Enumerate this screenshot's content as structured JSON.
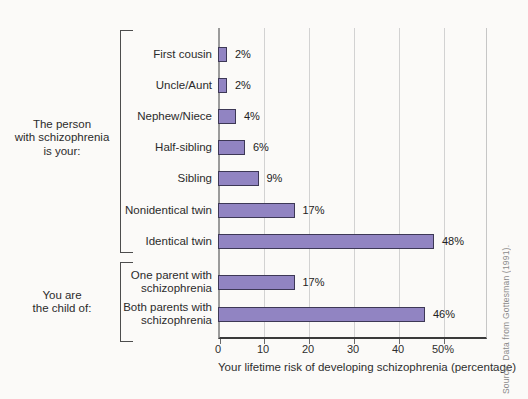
{
  "figure": {
    "background": "#fbfaf8"
  },
  "chart_data": {
    "type": "bar",
    "orientation": "horizontal",
    "title": "",
    "xlabel": "Your lifetime risk of developing schizophrenia (percentage)",
    "ylabel": "",
    "xlim": [
      0,
      59
    ],
    "xticks": [
      0,
      10,
      20,
      30,
      40,
      50
    ],
    "xtick_labels": [
      "0",
      "10",
      "20",
      "30",
      "40",
      "50%"
    ],
    "grid": true,
    "legend": "none",
    "bar_color": "#9184c2",
    "bar_border_color": "#3d3856",
    "groups": [
      {
        "label_lines": [
          "The person",
          "with schizophrenia",
          "is your:"
        ],
        "rows": [
          {
            "category_lines": [
              "First cousin"
            ],
            "value": 2,
            "value_label": "2%"
          },
          {
            "category_lines": [
              "Uncle/Aunt"
            ],
            "value": 2,
            "value_label": "2%"
          },
          {
            "category_lines": [
              "Nephew/Niece"
            ],
            "value": 4,
            "value_label": "4%"
          },
          {
            "category_lines": [
              "Half-sibling"
            ],
            "value": 6,
            "value_label": "6%"
          },
          {
            "category_lines": [
              "Sibling"
            ],
            "value": 9,
            "value_label": "9%"
          },
          {
            "category_lines": [
              "Nonidentical twin"
            ],
            "value": 17,
            "value_label": "17%"
          },
          {
            "category_lines": [
              "Identical twin"
            ],
            "value": 48,
            "value_label": "48%"
          }
        ]
      },
      {
        "label_lines": [
          "You are",
          "the child of:"
        ],
        "rows": [
          {
            "category_lines": [
              "One parent with",
              "schizophrenia"
            ],
            "value": 17,
            "value_label": "17%"
          },
          {
            "category_lines": [
              "Both parents with",
              "schizophrenia"
            ],
            "value": 46,
            "value_label": "46%"
          }
        ]
      }
    ],
    "source": "Source: Data from Gottesman (1991)."
  }
}
